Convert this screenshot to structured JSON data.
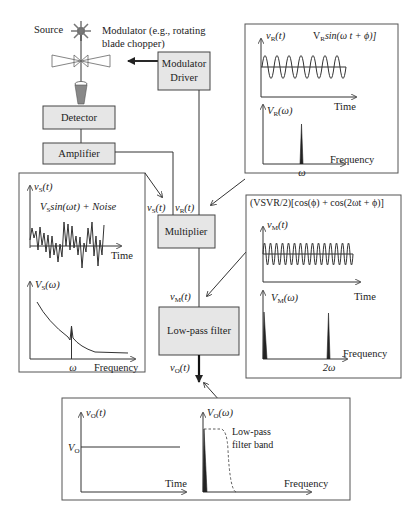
{
  "source": {
    "label": "Source"
  },
  "modulator": {
    "label_line1": "Modulator (e.g., rotating",
    "label_line2": "blade chopper)"
  },
  "blocks": {
    "modulator_driver": {
      "line1": "Modulator",
      "line2": "Driver"
    },
    "detector": {
      "label": "Detector"
    },
    "amplifier": {
      "label": "Amplifier"
    },
    "multiplier": {
      "label": "Multiplier"
    },
    "lowpass": {
      "label": "Low-pass filter"
    }
  },
  "signals": {
    "vs": "v",
    "vs_sub": "S",
    "vr": "v",
    "vr_sub": "R",
    "vm": "v",
    "vm_sub": "M",
    "vo": "v",
    "vo_sub": "O",
    "arg_t": "(t)"
  },
  "reference_panel": {
    "time_ylabel": "v",
    "time_ylabel_sub": "R",
    "time_ylabel_arg": "(t)",
    "formula_prefix": "V",
    "formula_sub": "R",
    "formula_body": "sin(ω t + ϕ)]",
    "time_xlabel": "Time",
    "freq_ylabel": "V",
    "freq_ylabel_sub": "R",
    "freq_ylabel_arg": "(ω)",
    "freq_xlabel": "Frequency",
    "freq_tick": "ω"
  },
  "signal_panel": {
    "time_ylabel": "v",
    "time_ylabel_sub": "S",
    "time_ylabel_arg": "(t)",
    "formula_prefix": "V",
    "formula_sub": "S",
    "formula_body": "sin(ωt) + Noise",
    "time_xlabel": "Time",
    "freq_ylabel": "V",
    "freq_ylabel_sub": "S",
    "freq_ylabel_arg": "(ω)",
    "freq_xlabel": "Frequency",
    "freq_tick": "ω"
  },
  "multiplier_panel": {
    "formula": "(VSVR/2)[cos(ϕ) + cos(2ωt + ϕ)]",
    "time_ylabel": "v",
    "time_ylabel_sub": "M",
    "time_ylabel_arg": "(t)",
    "time_xlabel": "Time",
    "freq_ylabel": "V",
    "freq_ylabel_sub": "M",
    "freq_ylabel_arg": "(ω)",
    "freq_xlabel": "Frequency",
    "freq_tick": "2ω"
  },
  "output_panel": {
    "time_ylabel": "v",
    "time_ylabel_sub": "O",
    "time_ylabel_arg": "(t)",
    "level_label": "V",
    "level_sub": "O",
    "time_xlabel": "Time",
    "freq_ylabel": "V",
    "freq_ylabel_sub": "O",
    "freq_ylabel_arg": "(ω)",
    "band_line1": "Low-pass",
    "band_line2": "filter band",
    "freq_xlabel": "Frequency"
  }
}
